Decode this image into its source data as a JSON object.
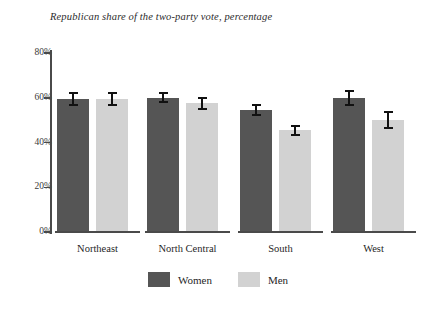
{
  "chart_data": {
    "type": "bar",
    "title": "Republican share of the two-party vote, percentage",
    "xlabel": "",
    "ylabel": "",
    "ylim": [
      0,
      80
    ],
    "ytick_labels": [
      "0%",
      "20%",
      "40%",
      "60%",
      "80%"
    ],
    "ytick_values": [
      0,
      20,
      40,
      60,
      80
    ],
    "grid": false,
    "legend_position": "bottom-center",
    "categories": [
      "Northeast",
      "North Central",
      "South",
      "West"
    ],
    "series": [
      {
        "name": "Women",
        "color": "#555555",
        "values": [
          59.5,
          60.0,
          54.5,
          60.0
        ],
        "errors": [
          3.0,
          2.5,
          2.5,
          3.5
        ]
      },
      {
        "name": "Men",
        "color": "#d2d2d2",
        "values": [
          59.5,
          57.5,
          45.5,
          50.0
        ],
        "errors": [
          3.0,
          3.0,
          2.5,
          4.0
        ]
      }
    ]
  },
  "legend": {
    "items": [
      {
        "label": "Women",
        "swatch": "legend-swatch-women",
        "color": "#555555"
      },
      {
        "label": "Men",
        "swatch": "legend-swatch-men",
        "color": "#d2d2d2"
      }
    ]
  }
}
